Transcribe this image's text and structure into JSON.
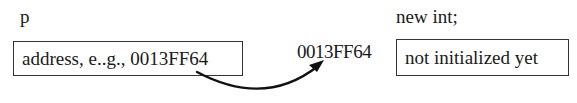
{
  "pointer": {
    "name": "p",
    "value": "address, e..g., 0013FF64"
  },
  "heap": {
    "expression": "new int;",
    "address": "0013FF64",
    "value": "not initialized yet"
  },
  "arrow": {
    "from": "pointer-box",
    "to": "heap-address",
    "color": "#111111"
  }
}
